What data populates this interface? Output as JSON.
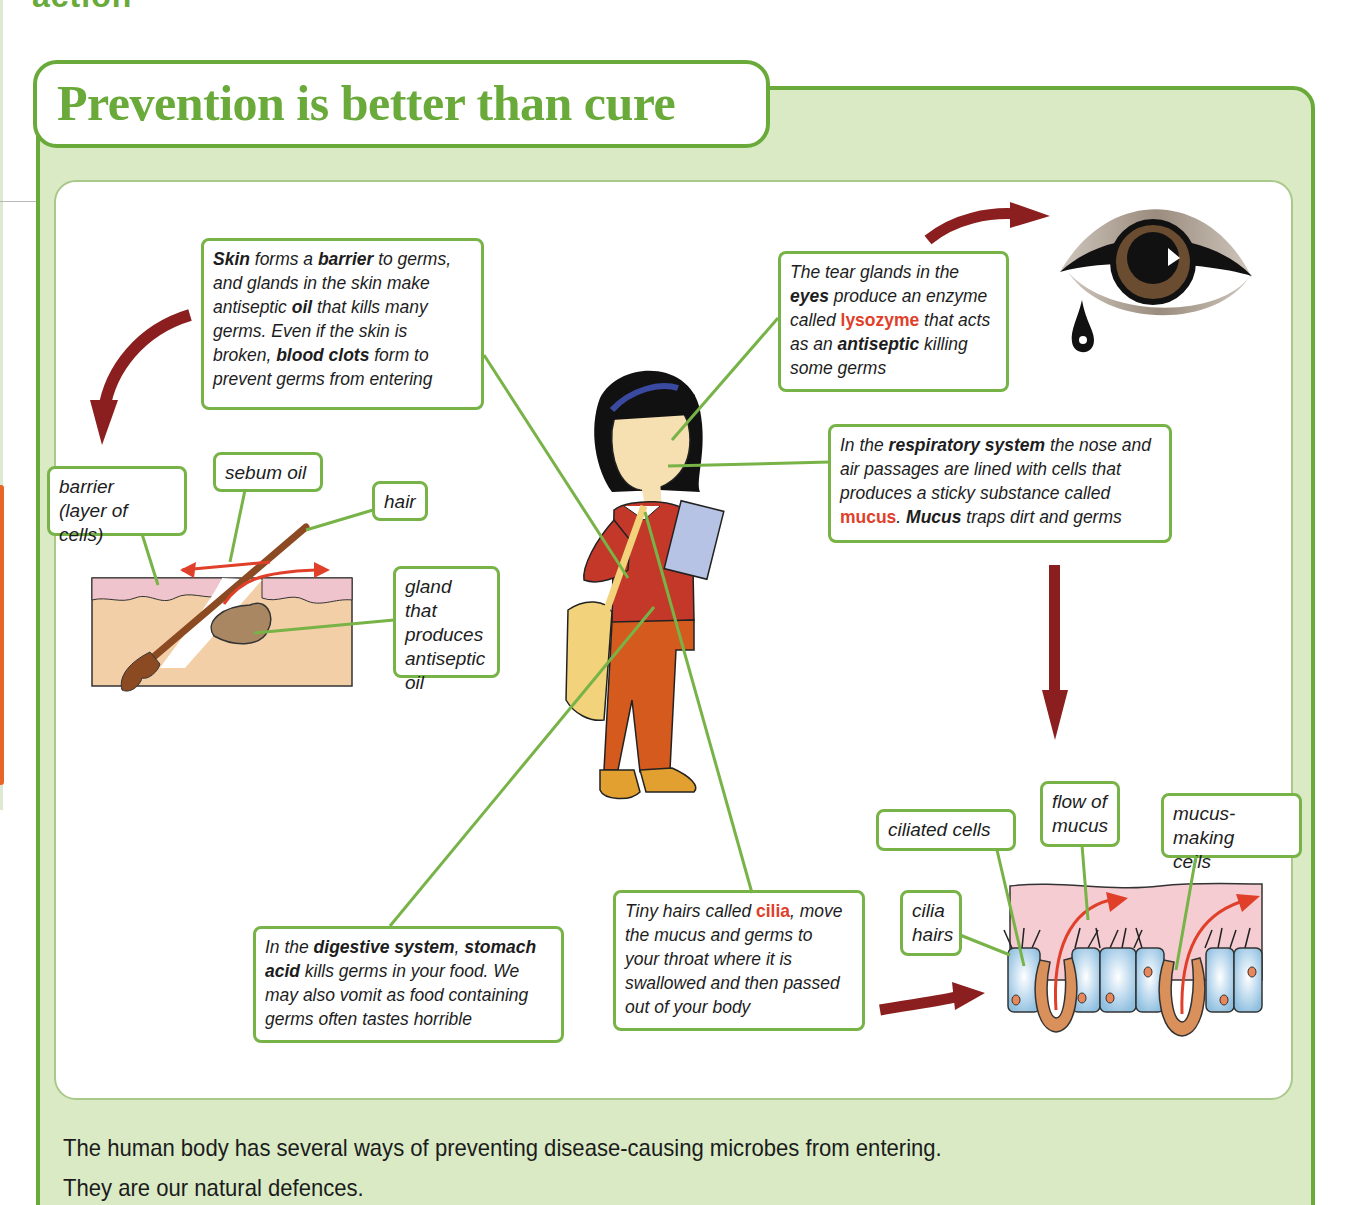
{
  "page": {
    "clipped_heading": "action",
    "title": "Prevention is better than cure",
    "footer": {
      "line1": "The human body has several ways of preventing disease-causing microbes from entering.",
      "line2": "They are our natural defences."
    }
  },
  "colors": {
    "brand_green": "#6aaa3a",
    "panel_green": "#d9eac5",
    "highlight_red": "#e0402a",
    "arrow_maroon": "#8b1f1f"
  },
  "callouts": {
    "skin": {
      "lines": [
        [
          {
            "t": "Skin",
            "b": true
          },
          {
            "t": " forms a "
          },
          {
            "t": "barrier",
            "b": true
          },
          {
            "t": " to germs,"
          }
        ],
        [
          {
            "t": "and glands in the skin make"
          }
        ],
        [
          {
            "t": "antiseptic "
          },
          {
            "t": "oil",
            "b": true
          },
          {
            "t": " that kills many"
          }
        ],
        [
          {
            "t": "germs. Even if the skin is"
          }
        ],
        [
          {
            "t": "broken, "
          },
          {
            "t": "blood clots",
            "b": true
          },
          {
            "t": " form to"
          }
        ],
        [
          {
            "t": "prevent germs from entering"
          }
        ]
      ]
    },
    "eyes": {
      "lines": [
        [
          {
            "t": "The tear glands in the"
          }
        ],
        [
          {
            "t": "eyes",
            "b": true
          },
          {
            "t": " produce an enzyme"
          }
        ],
        [
          {
            "t": "called "
          },
          {
            "t": "lysozyme",
            "r": true
          },
          {
            "t": " that acts"
          }
        ],
        [
          {
            "t": "as an "
          },
          {
            "t": "antiseptic",
            "b": true
          },
          {
            "t": " killing"
          }
        ],
        [
          {
            "t": "some germs"
          }
        ]
      ]
    },
    "respiratory": {
      "lines": [
        [
          {
            "t": "In the "
          },
          {
            "t": "respiratory system",
            "b": true
          },
          {
            "t": " the nose and"
          }
        ],
        [
          {
            "t": "air passages are lined with cells that"
          }
        ],
        [
          {
            "t": "produces a sticky substance called"
          }
        ],
        [
          {
            "t": "mucus",
            "r": true
          },
          {
            "t": ". "
          },
          {
            "t": "Mucus",
            "b": true
          },
          {
            "t": " traps dirt and germs"
          }
        ]
      ]
    },
    "digestive": {
      "lines": [
        [
          {
            "t": "In the "
          },
          {
            "t": "digestive system",
            "b": true
          },
          {
            "t": ", "
          },
          {
            "t": "stomach",
            "b": true
          }
        ],
        [
          {
            "t": "acid",
            "b": true
          },
          {
            "t": " kills germs in your food. We"
          }
        ],
        [
          {
            "t": "may also vomit as food containing"
          }
        ],
        [
          {
            "t": "germs often tastes horrible"
          }
        ]
      ]
    },
    "cilia": {
      "lines": [
        [
          {
            "t": "Tiny hairs called "
          },
          {
            "t": "cilia",
            "r": true
          },
          {
            "t": ", move"
          }
        ],
        [
          {
            "t": "the mucus and germs to"
          }
        ],
        [
          {
            "t": "your throat where it is"
          }
        ],
        [
          {
            "t": "swallowed and then passed"
          }
        ],
        [
          {
            "t": "out of your body"
          }
        ]
      ]
    }
  },
  "labels": {
    "barrier": [
      "barrier",
      "(layer of cells)"
    ],
    "sebum_oil": [
      "sebum oil"
    ],
    "hair": [
      "hair"
    ],
    "gland": [
      "gland that",
      "produces",
      "antiseptic",
      "oil"
    ],
    "ciliated_cells": [
      "ciliated cells"
    ],
    "flow_of_mucus": [
      "flow of",
      "mucus"
    ],
    "mucus_making_cells": [
      "mucus-making",
      "cells"
    ],
    "cilia_hairs": [
      "cilia",
      "hairs"
    ]
  },
  "icons": {
    "eye": "eye-with-tear-icon",
    "girl": "schoolgirl-illustration",
    "skin": "skin-cross-section-illustration",
    "airway": "ciliated-epithelium-illustration"
  }
}
